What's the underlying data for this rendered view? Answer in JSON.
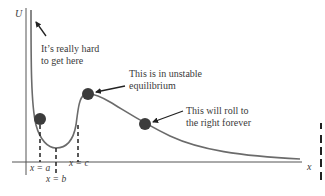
{
  "diagram": {
    "type": "potential-energy-curve",
    "axes": {
      "y_label": "U",
      "x_label": "x"
    },
    "annotations": [
      {
        "id": "hard",
        "lines": [
          "It’s really hard",
          "to get here"
        ]
      },
      {
        "id": "unstable",
        "lines": [
          "This is in unstable",
          "equilibrium"
        ]
      },
      {
        "id": "roll",
        "lines": [
          "This will roll to",
          "the right forever"
        ]
      }
    ],
    "markers": [
      {
        "id": "a",
        "label": "x = a"
      },
      {
        "id": "b",
        "label": "x = b"
      },
      {
        "id": "c",
        "label": "x = c"
      }
    ],
    "balls": [
      {
        "id": "ball-left-wall",
        "description": "ball on left wall near x=a"
      },
      {
        "id": "ball-peak",
        "description": "ball at local maximum (unstable equilibrium)"
      },
      {
        "id": "ball-slope",
        "description": "ball on descending slope"
      }
    ],
    "colors": {
      "curve": "#6b6b6b",
      "axis": "#555555",
      "ball": "#3c3c3c",
      "text": "#3a3a3a"
    }
  }
}
